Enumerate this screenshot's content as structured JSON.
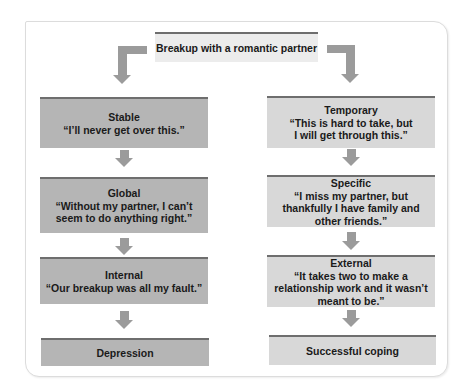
{
  "diagram": {
    "root": {
      "label": "Breakup with a romantic partner"
    },
    "left_branch": [
      {
        "title": "Stable",
        "quote": "“I’ll never get over this.”"
      },
      {
        "title": "Global",
        "quote": "“Without my partner, I can’t seem to do anything right.”"
      },
      {
        "title": "Internal",
        "quote": "“Our breakup was all my fault.”"
      },
      {
        "title": "",
        "quote": "",
        "outcome": "Depression"
      }
    ],
    "right_branch": [
      {
        "title": "Temporary",
        "quote": "“This is hard to take, but I will get through this.”"
      },
      {
        "title": "Specific",
        "quote": "“I miss my partner, but thankfully I have family and other friends.”"
      },
      {
        "title": "External",
        "quote": "“It takes two to make a relationship work and it wasn’t meant to be.”"
      },
      {
        "title": "",
        "quote": "",
        "outcome": "Successful coping"
      }
    ],
    "colors": {
      "box_dark": "#b5b5b5",
      "box_light": "#d8d8d8",
      "box_top": "#ececec",
      "box_border": "#6e6e6e",
      "arrow": "#9b9b9b",
      "card_border": "#dcdcdc"
    }
  }
}
